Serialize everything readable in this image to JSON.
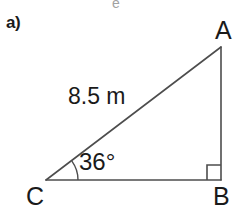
{
  "figure": {
    "part_label": "a)",
    "background_color": "#ffffff",
    "stroke_color": "#4d4d4d",
    "text_color": "#1a1a1a",
    "width": 249,
    "height": 216
  },
  "diagram": {
    "type": "right-triangle",
    "vertices": [
      {
        "name": "A",
        "label": "A",
        "x": 221,
        "y": 47
      },
      {
        "name": "B",
        "label": "B",
        "x": 221,
        "y": 180
      },
      {
        "name": "C",
        "label": "C",
        "x": 46,
        "y": 180
      }
    ],
    "sides": [
      {
        "name": "hypotenuse",
        "from": "C",
        "to": "A",
        "label": "8.5 m"
      },
      {
        "name": "vertical-leg",
        "from": "A",
        "to": "B",
        "label": ""
      },
      {
        "name": "base-leg",
        "from": "C",
        "to": "B",
        "label": ""
      }
    ],
    "angles": [
      {
        "at": "C",
        "label": "36°",
        "value": 36,
        "marker": "arc"
      },
      {
        "at": "B",
        "label": "",
        "value": 90,
        "marker": "square"
      }
    ],
    "right_angle_marker": {
      "size": 14
    },
    "angle_arc": {
      "radius": 32
    }
  },
  "artifacts": {
    "top_clipped_glyph": "e"
  }
}
